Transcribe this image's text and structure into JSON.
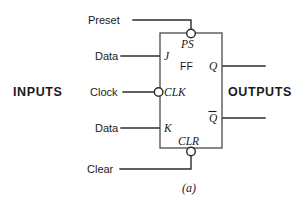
{
  "figure": {
    "caption": "(a)",
    "side_labels": {
      "inputs": "INPUTS",
      "outputs": "OUTPUTS"
    },
    "colors": {
      "inputs_label": "#a8a8a8",
      "outputs_label": "#cfcfcf",
      "wire": "#2b2b2b",
      "box_border": "#4a4a4a",
      "background": "#ffffff",
      "text": "#1a1a1a"
    },
    "body_labels": {
      "preset_pin": "PS",
      "device": "FF",
      "clear_pin": "CLR",
      "j_pin": "J",
      "clock_pin": "CLK",
      "k_pin": "K",
      "q_pin": "Q",
      "qbar_pin": "Q"
    },
    "external_labels": {
      "preset": "Preset",
      "data_j": "Data",
      "clock": "Clock",
      "data_k": "Data",
      "clear": "Clear"
    }
  }
}
